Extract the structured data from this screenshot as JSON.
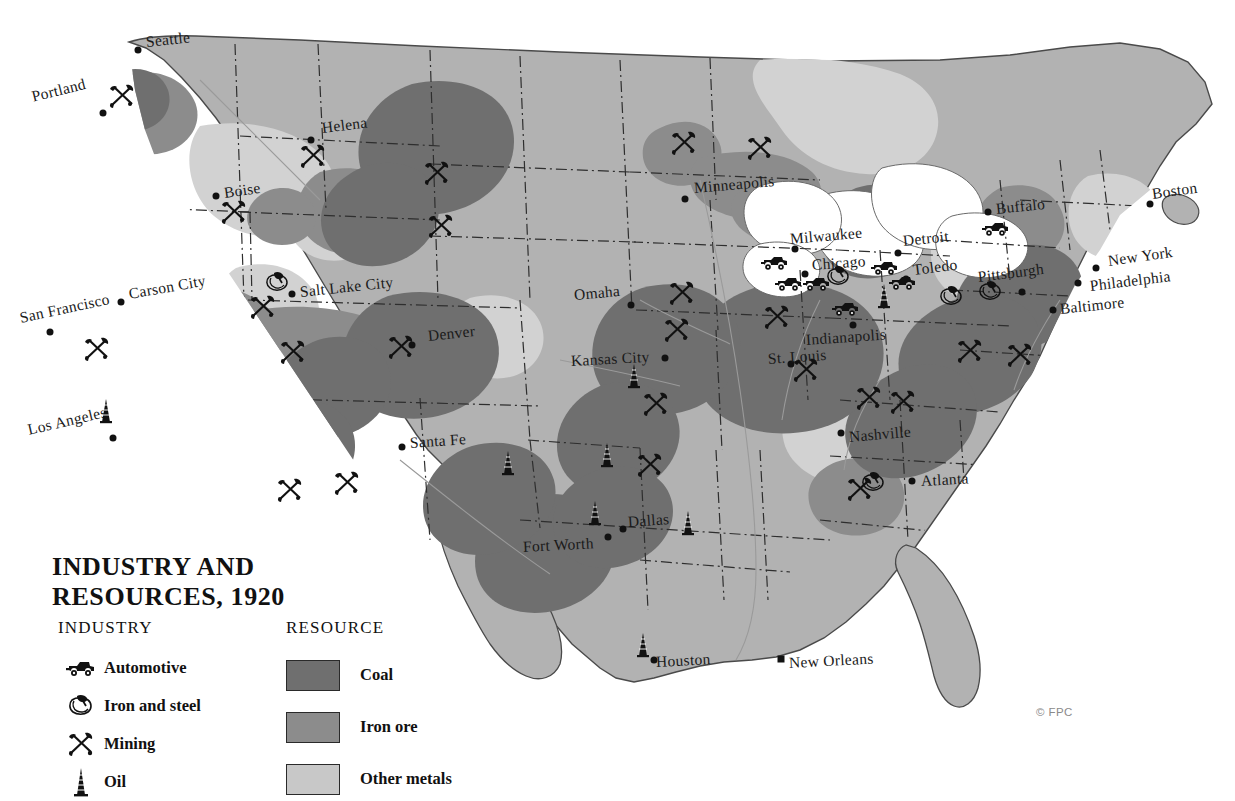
{
  "title": {
    "line1": "INDUSTRY AND",
    "line2": "RESOURCES, 1920"
  },
  "credit": "© FPC",
  "legend": {
    "industry": {
      "heading": "INDUSTRY",
      "items": [
        {
          "icon": "automotive-icon",
          "label": "Automotive"
        },
        {
          "icon": "iron-and-steel-icon",
          "label": "Iron and steel"
        },
        {
          "icon": "mining-icon",
          "label": "Mining"
        },
        {
          "icon": "oil-derrick-icon",
          "label": "Oil"
        }
      ]
    },
    "resource": {
      "heading": "RESOURCE",
      "items": [
        {
          "label": "Coal",
          "color": "#6f6f6f"
        },
        {
          "label": "Iron ore",
          "color": "#8c8c8c"
        },
        {
          "label": "Other metals",
          "color": "#c8c8c8"
        }
      ]
    }
  },
  "colors": {
    "land": "#b2b2b2",
    "coal": "#6f6f6f",
    "iron_ore": "#8c8c8c",
    "other_metals": "#d2d2d2",
    "water": "#ffffff",
    "outline": "#4a4a4a",
    "border_line": "#2e2e2e",
    "ink": "#111111"
  },
  "cities": [
    {
      "name": "Seattle",
      "x": 138,
      "y": 50,
      "lx": 146,
      "ly": 33,
      "rot": -6,
      "marker": "dot"
    },
    {
      "name": "Portland",
      "x": 103,
      "y": 113,
      "lx": 32,
      "ly": 88,
      "rot": -14,
      "marker": "dot"
    },
    {
      "name": "Helena",
      "x": 311,
      "y": 140,
      "lx": 322,
      "ly": 119,
      "rot": -7,
      "marker": "dot"
    },
    {
      "name": "Boise",
      "x": 216,
      "y": 196,
      "lx": 224,
      "ly": 184,
      "rot": -8,
      "marker": "dot"
    },
    {
      "name": "Carson City",
      "x": 121,
      "y": 302,
      "lx": 129,
      "ly": 285,
      "rot": -10,
      "marker": "dot"
    },
    {
      "name": "San Francisco",
      "x": 50,
      "y": 332,
      "lx": 20,
      "ly": 309,
      "rot": -12,
      "marker": "dot"
    },
    {
      "name": "Los Angeles",
      "x": 113,
      "y": 438,
      "lx": 28,
      "ly": 421,
      "rot": -13,
      "marker": "dot"
    },
    {
      "name": "Salt Lake City",
      "x": 292,
      "y": 294,
      "lx": 300,
      "ly": 283,
      "rot": -6,
      "marker": "dot"
    },
    {
      "name": "Denver",
      "x": 412,
      "y": 345,
      "lx": 428,
      "ly": 327,
      "rot": -6,
      "marker": "dot"
    },
    {
      "name": "Santa Fe",
      "x": 402,
      "y": 447,
      "lx": 410,
      "ly": 434,
      "rot": -4,
      "marker": "dot"
    },
    {
      "name": "Omaha",
      "x": 631,
      "y": 305,
      "lx": 574,
      "ly": 286,
      "rot": -5,
      "marker": "dot"
    },
    {
      "name": "Kansas City",
      "x": 665,
      "y": 358,
      "lx": 571,
      "ly": 352,
      "rot": -3,
      "marker": "dot"
    },
    {
      "name": "Minneapolis",
      "x": 685,
      "y": 199,
      "lx": 694,
      "ly": 179,
      "rot": -5,
      "marker": "dot"
    },
    {
      "name": "Milwaukee",
      "x": 795,
      "y": 249,
      "lx": 790,
      "ly": 230,
      "rot": -5,
      "marker": "dot"
    },
    {
      "name": "Chicago",
      "x": 805,
      "y": 274,
      "lx": 812,
      "ly": 256,
      "rot": -4,
      "marker": "dot"
    },
    {
      "name": "Detroit",
      "x": 898,
      "y": 253,
      "lx": 903,
      "ly": 232,
      "rot": -6,
      "marker": "dot"
    },
    {
      "name": "Toledo",
      "x": 906,
      "y": 279,
      "lx": 913,
      "ly": 261,
      "rot": -7,
      "marker": "dot"
    },
    {
      "name": "St. Louis",
      "x": 791,
      "y": 364,
      "lx": 768,
      "ly": 350,
      "rot": -4,
      "marker": "dot"
    },
    {
      "name": "Indianapolis",
      "x": 853,
      "y": 325,
      "lx": 806,
      "ly": 331,
      "rot": -4,
      "marker": "dot"
    },
    {
      "name": "Buffalo",
      "x": 988,
      "y": 212,
      "lx": 996,
      "ly": 200,
      "rot": -6,
      "marker": "dot"
    },
    {
      "name": "Pittsburgh",
      "x": 1022,
      "y": 292,
      "lx": 978,
      "ly": 268,
      "rot": -7,
      "marker": "dot"
    },
    {
      "name": "Boston",
      "x": 1150,
      "y": 204,
      "lx": 1152,
      "ly": 185,
      "rot": -8,
      "marker": "dot"
    },
    {
      "name": "New York",
      "x": 1096,
      "y": 268,
      "lx": 1108,
      "ly": 252,
      "rot": -8,
      "marker": "dot"
    },
    {
      "name": "Philadelphia",
      "x": 1078,
      "y": 283,
      "lx": 1090,
      "ly": 277,
      "rot": -7,
      "marker": "dot"
    },
    {
      "name": "Baltimore",
      "x": 1053,
      "y": 310,
      "lx": 1060,
      "ly": 300,
      "rot": -6,
      "marker": "dot"
    },
    {
      "name": "Nashville",
      "x": 841,
      "y": 433,
      "lx": 849,
      "ly": 428,
      "rot": -5,
      "marker": "dot"
    },
    {
      "name": "Atlanta",
      "x": 912,
      "y": 481,
      "lx": 921,
      "ly": 472,
      "rot": -3,
      "marker": "dot"
    },
    {
      "name": "Dallas",
      "x": 623,
      "y": 529,
      "lx": 628,
      "ly": 513,
      "rot": -4,
      "marker": "dot"
    },
    {
      "name": "Fort Worth",
      "x": 608,
      "y": 537,
      "lx": 523,
      "ly": 538,
      "rot": -3,
      "marker": "dot"
    },
    {
      "name": "Houston",
      "x": 654,
      "y": 660,
      "lx": 656,
      "ly": 653,
      "rot": -3,
      "marker": "dot"
    },
    {
      "name": "New Orleans",
      "x": 781,
      "y": 659,
      "lx": 789,
      "ly": 654,
      "rot": -3,
      "marker": "square"
    }
  ],
  "industry_markers": [
    {
      "type": "mining",
      "x": 122,
      "y": 96
    },
    {
      "type": "mining",
      "x": 313,
      "y": 156
    },
    {
      "type": "mining",
      "x": 437,
      "y": 173
    },
    {
      "type": "mining",
      "x": 441,
      "y": 226
    },
    {
      "type": "mining",
      "x": 234,
      "y": 212
    },
    {
      "type": "mining",
      "x": 263,
      "y": 307
    },
    {
      "type": "ironsteel",
      "x": 277,
      "y": 282
    },
    {
      "type": "mining",
      "x": 97,
      "y": 349
    },
    {
      "type": "mining",
      "x": 293,
      "y": 352
    },
    {
      "type": "mining",
      "x": 401,
      "y": 347
    },
    {
      "type": "mining",
      "x": 290,
      "y": 490
    },
    {
      "type": "mining",
      "x": 347,
      "y": 483
    },
    {
      "type": "oil",
      "x": 106,
      "y": 411
    },
    {
      "type": "mining",
      "x": 684,
      "y": 143
    },
    {
      "type": "mining",
      "x": 760,
      "y": 148
    },
    {
      "type": "mining",
      "x": 682,
      "y": 293
    },
    {
      "type": "mining",
      "x": 677,
      "y": 330
    },
    {
      "type": "mining",
      "x": 777,
      "y": 317
    },
    {
      "type": "mining",
      "x": 806,
      "y": 370
    },
    {
      "type": "mining",
      "x": 656,
      "y": 404
    },
    {
      "type": "oil",
      "x": 634,
      "y": 376
    },
    {
      "type": "oil",
      "x": 508,
      "y": 463
    },
    {
      "type": "oil",
      "x": 607,
      "y": 455
    },
    {
      "type": "mining",
      "x": 650,
      "y": 465
    },
    {
      "type": "oil",
      "x": 595,
      "y": 513
    },
    {
      "type": "oil",
      "x": 688,
      "y": 523
    },
    {
      "type": "oil",
      "x": 643,
      "y": 645
    },
    {
      "type": "oil",
      "x": 884,
      "y": 296
    },
    {
      "type": "auto",
      "x": 775,
      "y": 262
    },
    {
      "type": "auto",
      "x": 789,
      "y": 283
    },
    {
      "type": "auto",
      "x": 817,
      "y": 283
    },
    {
      "type": "auto",
      "x": 885,
      "y": 267
    },
    {
      "type": "auto",
      "x": 903,
      "y": 282
    },
    {
      "type": "auto",
      "x": 846,
      "y": 308
    },
    {
      "type": "auto",
      "x": 996,
      "y": 228
    },
    {
      "type": "ironsteel",
      "x": 838,
      "y": 276
    },
    {
      "type": "ironsteel",
      "x": 951,
      "y": 296
    },
    {
      "type": "ironsteel",
      "x": 990,
      "y": 291
    },
    {
      "type": "mining",
      "x": 970,
      "y": 351
    },
    {
      "type": "mining",
      "x": 1020,
      "y": 355
    },
    {
      "type": "mining",
      "x": 903,
      "y": 402
    },
    {
      "type": "mining",
      "x": 869,
      "y": 398
    },
    {
      "type": "mining",
      "x": 860,
      "y": 489
    },
    {
      "type": "ironsteel",
      "x": 873,
      "y": 482
    }
  ]
}
